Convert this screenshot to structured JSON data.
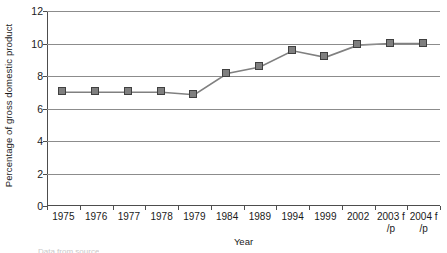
{
  "chart_data": {
    "type": "line",
    "title": "",
    "xlabel": "Year",
    "ylabel": "Percentage of gross domestic product",
    "categories": [
      "1975",
      "1976",
      "1977",
      "1978",
      "1979",
      "1984",
      "1989",
      "1994",
      "1999",
      "2002",
      "2003 f/p",
      "2004 f/p"
    ],
    "category_lines": [
      [
        "1975",
        ""
      ],
      [
        "1976",
        ""
      ],
      [
        "1977",
        ""
      ],
      [
        "1978",
        ""
      ],
      [
        "1979",
        ""
      ],
      [
        "1984",
        ""
      ],
      [
        "1989",
        ""
      ],
      [
        "1994",
        ""
      ],
      [
        "1999",
        ""
      ],
      [
        "2002",
        ""
      ],
      [
        "2003 f",
        "/p"
      ],
      [
        "2004 f",
        "/p"
      ]
    ],
    "values": [
      7.0,
      7.0,
      7.0,
      7.0,
      6.85,
      8.15,
      8.55,
      9.55,
      9.15,
      9.9,
      10.0,
      10.0
    ],
    "ylim": [
      0,
      12
    ],
    "yticks": [
      0,
      2,
      4,
      6,
      8,
      10,
      12
    ],
    "ytick_labels": [
      "0",
      "2",
      "4",
      "6",
      "8",
      "10",
      "12"
    ],
    "grid": true,
    "grid_axis": "y",
    "legend": "none",
    "marker": "square",
    "series_color": "#7f7f7f",
    "marker_border_color": "#404040",
    "line_color": "#808080",
    "grid_color": "#8c8c8c",
    "axis_color": "#4d4d4d"
  },
  "caption_sliver": "Data from source"
}
